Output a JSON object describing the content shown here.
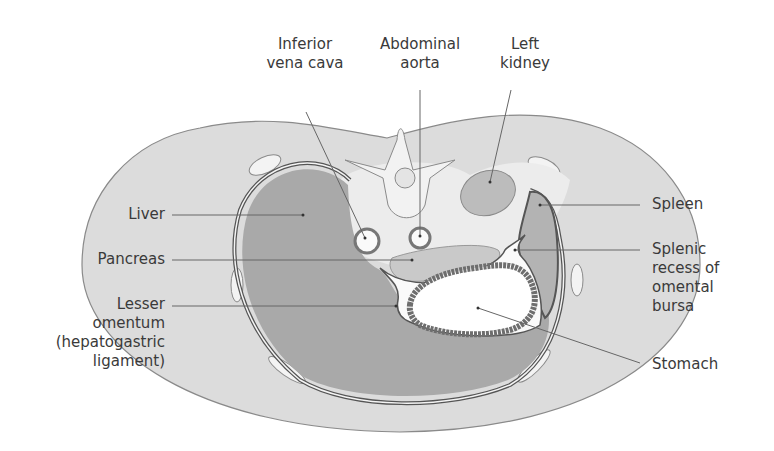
{
  "figure": {
    "colors": {
      "body_wall": "#dcdcdc",
      "outline": "#8a8a8a",
      "organ_dark": "#a9a9a9",
      "organ_mid": "#bdbdbd",
      "retroperitoneum": "#e9e9e9",
      "bursa_white": "#fafafa",
      "stomach_wall": "#6e6e6e",
      "label_text": "#3a3a3a",
      "leader_line": "#666666"
    }
  },
  "labels": {
    "ivc": [
      "Inferior",
      "vena cava"
    ],
    "aorta": [
      "Abdominal",
      "aorta"
    ],
    "kidney": [
      "Left",
      "kidney"
    ],
    "liver": [
      "Liver"
    ],
    "pancreas": [
      "Pancreas"
    ],
    "lesser_omentum": [
      "Lesser",
      "omentum",
      "(hepatogastric",
      "ligament)"
    ],
    "spleen": [
      "Spleen"
    ],
    "splenic_recess": [
      "Splenic",
      "recess of",
      "omental",
      "bursa"
    ],
    "stomach": [
      "Stomach"
    ]
  }
}
